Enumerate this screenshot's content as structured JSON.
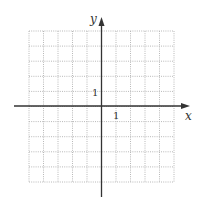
{
  "diagram": {
    "type": "coordinate-plane",
    "grid": {
      "columns": 10,
      "rows": 10,
      "style": "dotted",
      "color": "#b8b8b8",
      "left": 29,
      "top": 31,
      "right": 174,
      "bottom": 182
    },
    "axes": {
      "color": "#333333",
      "x_axis": {
        "label": "x",
        "y": 106,
        "from": 14,
        "to": 190
      },
      "y_axis": {
        "label": "y",
        "x": 101.5,
        "from": 197,
        "to": 17
      }
    },
    "tick_labels": {
      "x_unit": "1",
      "y_unit": "1"
    }
  }
}
